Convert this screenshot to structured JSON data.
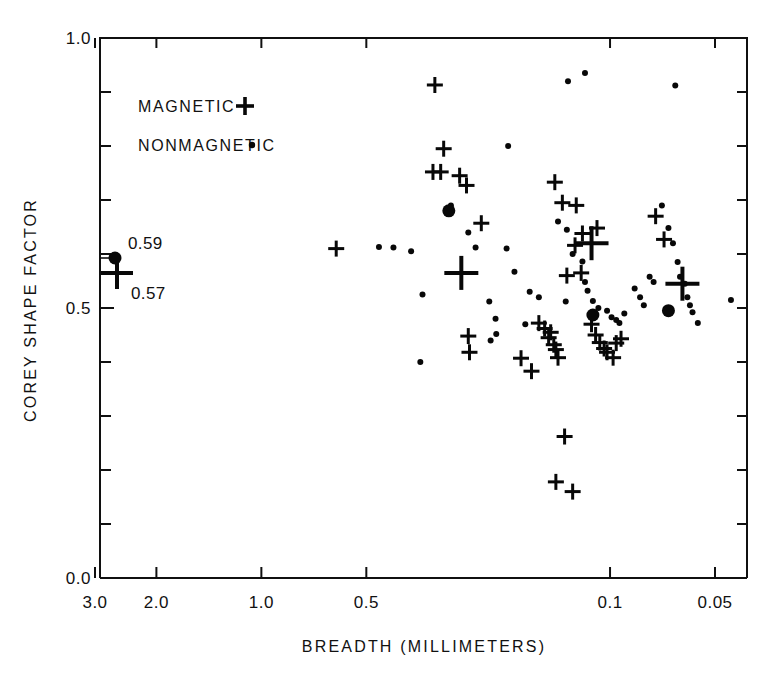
{
  "chart_data": {
    "type": "scatter",
    "title": "",
    "xlabel": "BREADTH (MILLIMETERS)",
    "ylabel": "COREY SHAPE FACTOR",
    "xscale": "log-reversed",
    "xlim": [
      3.4,
      0.042
    ],
    "ylim": [
      0.0,
      1.0
    ],
    "grid": false,
    "legend_position": "upper-left-inside",
    "x_ticks": [
      {
        "value": 3.0,
        "label": "3.0"
      },
      {
        "value": 2.0,
        "label": "2.0"
      },
      {
        "value": 1.0,
        "label": "1.0"
      },
      {
        "value": 0.5,
        "label": "0.5"
      },
      {
        "value": 0.1,
        "label": "0.1"
      },
      {
        "value": 0.05,
        "label": "0.05"
      }
    ],
    "y_ticks": [
      {
        "value": 1.0,
        "label": "1.0"
      },
      {
        "value": 0.9,
        "label": ""
      },
      {
        "value": 0.8,
        "label": ""
      },
      {
        "value": 0.7,
        "label": ""
      },
      {
        "value": 0.6,
        "label": ""
      },
      {
        "value": 0.5,
        "label": "0.5"
      },
      {
        "value": 0.4,
        "label": ""
      },
      {
        "value": 0.3,
        "label": ""
      },
      {
        "value": 0.2,
        "label": ""
      },
      {
        "value": 0.1,
        "label": ""
      },
      {
        "value": 0.0,
        "label": "0.0"
      }
    ],
    "legend": [
      {
        "name": "magnetic",
        "label": "MAGNETIC",
        "marker": "cross"
      },
      {
        "name": "nonmagnetic",
        "label": "NONMAGNETIC",
        "marker": "dot"
      }
    ],
    "annotations": [
      {
        "name": "nonmagnetic-mean",
        "label": "0.59",
        "value": 0.59,
        "marker": "bigdot",
        "x_px": 115,
        "y_px": 258
      },
      {
        "name": "magnetic-mean",
        "label": "0.57",
        "value": 0.57,
        "marker": "bigcross",
        "x_px": 117,
        "y_px": 273
      }
    ],
    "series": [
      {
        "name": "magnetic",
        "marker": "cross",
        "points": [
          [
            0.318,
            0.913
          ],
          [
            0.3,
            0.795
          ],
          [
            0.322,
            0.752
          ],
          [
            0.306,
            0.752
          ],
          [
            0.27,
            0.745
          ],
          [
            0.258,
            0.727
          ],
          [
            0.61,
            0.61
          ],
          [
            0.234,
            0.657
          ],
          [
            0.144,
            0.733
          ],
          [
            0.137,
            0.695
          ],
          [
            0.125,
            0.69
          ],
          [
            0.12,
            0.638
          ],
          [
            0.126,
            0.616
          ],
          [
            0.109,
            0.648
          ],
          [
            0.074,
            0.67
          ],
          [
            0.07,
            0.627
          ],
          [
            0.255,
            0.448
          ],
          [
            0.253,
            0.418
          ],
          [
            0.18,
            0.407
          ],
          [
            0.168,
            0.383
          ],
          [
            0.113,
            0.47
          ],
          [
            0.11,
            0.45
          ],
          [
            0.107,
            0.436
          ],
          [
            0.104,
            0.425
          ],
          [
            0.102,
            0.418
          ],
          [
            0.098,
            0.408
          ],
          [
            0.096,
            0.435
          ],
          [
            0.093,
            0.443
          ],
          [
            0.145,
            0.432
          ],
          [
            0.143,
            0.423
          ],
          [
            0.141,
            0.408
          ],
          [
            0.15,
            0.445
          ],
          [
            0.148,
            0.455
          ],
          [
            0.154,
            0.462
          ],
          [
            0.16,
            0.472
          ],
          [
            0.135,
            0.262
          ],
          [
            0.143,
            0.178
          ],
          [
            0.128,
            0.16
          ],
          [
            0.133,
            0.56
          ],
          [
            0.121,
            0.565
          ]
        ]
      },
      {
        "name": "nonmagnetic",
        "marker": "dot",
        "points": [
          [
            0.286,
            0.69
          ],
          [
            0.255,
            0.64
          ],
          [
            0.243,
            0.612
          ],
          [
            0.46,
            0.613
          ],
          [
            0.418,
            0.612
          ],
          [
            0.372,
            0.605
          ],
          [
            0.198,
            0.61
          ],
          [
            0.196,
            0.8
          ],
          [
            0.188,
            0.567
          ],
          [
            0.345,
            0.525
          ],
          [
            0.35,
            0.4
          ],
          [
            0.222,
            0.512
          ],
          [
            0.213,
            0.48
          ],
          [
            0.16,
            0.52
          ],
          [
            0.132,
            0.92
          ],
          [
            0.118,
            0.935
          ],
          [
            0.141,
            0.66
          ],
          [
            0.133,
            0.645
          ],
          [
            0.128,
            0.6
          ],
          [
            0.12,
            0.586
          ],
          [
            0.118,
            0.548
          ],
          [
            0.116,
            0.532
          ],
          [
            0.112,
            0.513
          ],
          [
            0.108,
            0.5
          ],
          [
            0.102,
            0.495
          ],
          [
            0.099,
            0.483
          ],
          [
            0.096,
            0.478
          ],
          [
            0.094,
            0.472
          ],
          [
            0.091,
            0.49
          ],
          [
            0.134,
            0.512
          ],
          [
            0.085,
            0.536
          ],
          [
            0.082,
            0.52
          ],
          [
            0.08,
            0.505
          ],
          [
            0.077,
            0.558
          ],
          [
            0.075,
            0.548
          ],
          [
            0.071,
            0.69
          ],
          [
            0.068,
            0.648
          ],
          [
            0.066,
            0.62
          ],
          [
            0.064,
            0.585
          ],
          [
            0.063,
            0.558
          ],
          [
            0.061,
            0.545
          ],
          [
            0.06,
            0.52
          ],
          [
            0.059,
            0.505
          ],
          [
            0.058,
            0.492
          ],
          [
            0.056,
            0.472
          ],
          [
            0.065,
            0.912
          ],
          [
            0.22,
            0.44
          ],
          [
            0.212,
            0.452
          ],
          [
            0.17,
            0.53
          ],
          [
            0.175,
            0.47
          ],
          [
            0.045,
            0.515
          ]
        ]
      },
      {
        "name": "magnetic-group-means",
        "marker": "bigcross",
        "points": [
          [
            0.267,
            0.565
          ],
          [
            0.113,
            0.62
          ],
          [
            0.062,
            0.545
          ]
        ]
      },
      {
        "name": "nonmagnetic-group-means",
        "marker": "bigdot",
        "points": [
          [
            0.29,
            0.68
          ],
          [
            0.112,
            0.487
          ],
          [
            0.068,
            0.495
          ]
        ]
      }
    ]
  }
}
